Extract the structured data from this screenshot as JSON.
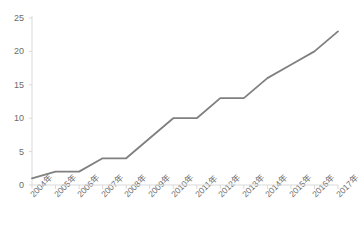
{
  "chart_data": {
    "type": "line",
    "title": "",
    "subtitle": "",
    "xlabel": "",
    "ylabel": "",
    "categories": [
      "2004年",
      "2005年",
      "2006年",
      "2007年",
      "2008年",
      "2009年",
      "2010年",
      "2011年",
      "2012年",
      "2013年",
      "2014年",
      "2015年",
      "2016年",
      "2017年"
    ],
    "values": [
      1,
      2,
      2,
      4,
      4,
      7,
      10,
      10,
      13,
      13,
      16,
      18,
      20,
      23
    ],
    "series": [
      {
        "name": "",
        "values": [
          1,
          2,
          2,
          4,
          4,
          7,
          10,
          10,
          13,
          13,
          16,
          18,
          20,
          23
        ],
        "color": "#808080"
      }
    ],
    "ylim": [
      0,
      25
    ],
    "ytick_labels": [
      "0",
      "5",
      "10",
      "15",
      "20",
      "25"
    ],
    "ytick_values": [
      0,
      5,
      10,
      15,
      20,
      25
    ],
    "grid": false,
    "legend": "none",
    "markers": false,
    "line_color": "#808080",
    "axis_color": "#d9d9d9",
    "tick_label_color": "#6b6b6b"
  }
}
